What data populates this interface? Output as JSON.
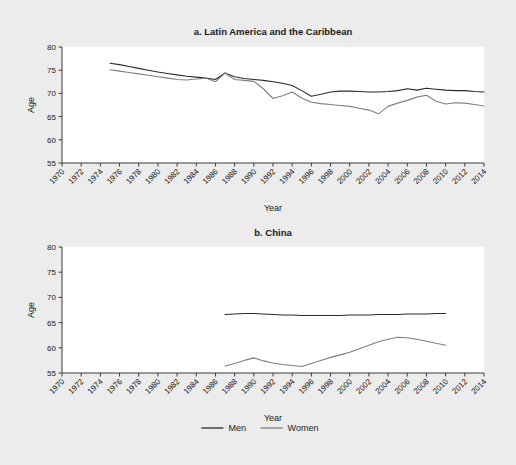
{
  "figure": {
    "background_color": "#ececec",
    "plot_background_color": "#ffffff",
    "axis_color": "#3a3a3a"
  },
  "legend": {
    "position": "bottom-center",
    "entries": [
      {
        "label": "Men",
        "color": "#2b2b2b"
      },
      {
        "label": "Women",
        "color": "#7f7f7f"
      }
    ]
  },
  "chart_data": [
    {
      "type": "line",
      "title": "a. Latin America and the Caribbean",
      "xlabel": "Year",
      "ylabel": "Age",
      "ylim": [
        55,
        80
      ],
      "yticks": [
        55,
        60,
        65,
        70,
        75,
        80
      ],
      "xlim": [
        1970,
        2014
      ],
      "xticks": [
        1970,
        1972,
        1974,
        1976,
        1978,
        1980,
        1982,
        1984,
        1986,
        1988,
        1990,
        1992,
        1994,
        1996,
        1998,
        2000,
        2002,
        2004,
        2006,
        2008,
        2010,
        2012,
        2014
      ],
      "grid": false,
      "legend_position": "bottom",
      "series": [
        {
          "name": "Men",
          "color": "#2b2b2b",
          "x": [
            1975,
            1976,
            1977,
            1978,
            1979,
            1980,
            1981,
            1982,
            1983,
            1984,
            1985,
            1986,
            1987,
            1988,
            1989,
            1990,
            1991,
            1992,
            1993,
            1994,
            1995,
            1996,
            1997,
            1998,
            1999,
            2000,
            2001,
            2002,
            2003,
            2004,
            2005,
            2006,
            2007,
            2008,
            2009,
            2010,
            2011,
            2012,
            2013,
            2014
          ],
          "values": [
            76.5,
            76.2,
            75.8,
            75.4,
            75.0,
            74.6,
            74.3,
            74.0,
            73.7,
            73.5,
            73.3,
            73.0,
            74.4,
            73.6,
            73.2,
            73.0,
            72.8,
            72.5,
            72.2,
            71.7,
            70.6,
            69.4,
            69.8,
            70.3,
            70.5,
            70.5,
            70.4,
            70.3,
            70.3,
            70.4,
            70.6,
            71.0,
            70.7,
            71.1,
            70.9,
            70.7,
            70.6,
            70.6,
            70.4,
            70.3
          ]
        },
        {
          "name": "Women",
          "color": "#7f7f7f",
          "x": [
            1975,
            1976,
            1977,
            1978,
            1979,
            1980,
            1981,
            1982,
            1983,
            1984,
            1985,
            1986,
            1987,
            1988,
            1989,
            1990,
            1991,
            1992,
            1993,
            1994,
            1995,
            1996,
            1997,
            1998,
            1999,
            2000,
            2001,
            2002,
            2003,
            2004,
            2005,
            2006,
            2007,
            2008,
            2009,
            2010,
            2011,
            2012,
            2013,
            2014
          ],
          "values": [
            75.1,
            74.8,
            74.5,
            74.2,
            73.9,
            73.6,
            73.3,
            73.0,
            72.9,
            73.1,
            73.3,
            72.5,
            74.4,
            73.0,
            72.8,
            72.6,
            71.0,
            68.9,
            69.5,
            70.3,
            69.0,
            68.1,
            67.8,
            67.6,
            67.4,
            67.2,
            66.8,
            66.4,
            65.6,
            67.2,
            67.9,
            68.5,
            69.2,
            69.6,
            68.3,
            67.7,
            68.0,
            67.9,
            67.6,
            67.3
          ]
        }
      ]
    },
    {
      "type": "line",
      "title": "b. China",
      "xlabel": "Year",
      "ylabel": "Age",
      "ylim": [
        55,
        80
      ],
      "yticks": [
        55,
        60,
        65,
        70,
        75,
        80
      ],
      "xlim": [
        1970,
        2014
      ],
      "xticks": [
        1970,
        1972,
        1974,
        1976,
        1978,
        1980,
        1982,
        1984,
        1986,
        1988,
        1990,
        1992,
        1994,
        1996,
        1998,
        2000,
        2002,
        2004,
        2006,
        2008,
        2010,
        2012,
        2014
      ],
      "grid": false,
      "legend_position": "bottom",
      "series": [
        {
          "name": "Men",
          "color": "#2b2b2b",
          "x": [
            1987,
            1988,
            1989,
            1990,
            1991,
            1992,
            1993,
            1994,
            1995,
            1996,
            1997,
            1998,
            1999,
            2000,
            2001,
            2002,
            2003,
            2004,
            2005,
            2006,
            2007,
            2008,
            2009,
            2010
          ],
          "values": [
            66.6,
            66.7,
            66.8,
            66.8,
            66.7,
            66.6,
            66.5,
            66.5,
            66.4,
            66.4,
            66.4,
            66.4,
            66.4,
            66.5,
            66.5,
            66.5,
            66.6,
            66.6,
            66.6,
            66.7,
            66.7,
            66.7,
            66.8,
            66.8
          ]
        },
        {
          "name": "Women",
          "color": "#7f7f7f",
          "x": [
            1987,
            1988,
            1989,
            1990,
            1991,
            1992,
            1993,
            1994,
            1995,
            1996,
            1997,
            1998,
            1999,
            2000,
            2001,
            2002,
            2003,
            2004,
            2005,
            2006,
            2007,
            2008,
            2009,
            2010
          ],
          "values": [
            56.4,
            56.9,
            57.5,
            58.0,
            57.4,
            57.0,
            56.7,
            56.5,
            56.3,
            56.9,
            57.5,
            58.1,
            58.6,
            59.1,
            59.8,
            60.5,
            61.2,
            61.7,
            62.1,
            62.0,
            61.7,
            61.3,
            60.9,
            60.5
          ]
        }
      ]
    }
  ]
}
